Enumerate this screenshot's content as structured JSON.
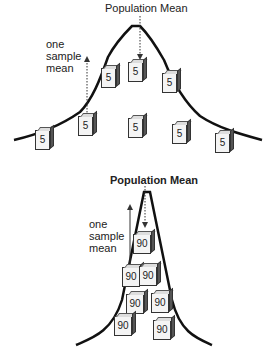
{
  "top_diagram": {
    "title": "Population Mean",
    "sample_label": "one sample mean",
    "sample_value": "5",
    "box_count": 8
  },
  "bottom_diagram": {
    "title": "Population Mean",
    "sample_label": "one sample mean",
    "sample_value": "90",
    "box_count": 7
  }
}
